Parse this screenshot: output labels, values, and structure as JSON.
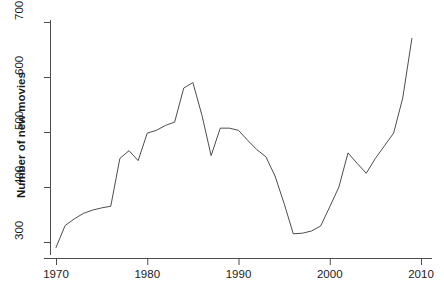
{
  "chart_data": {
    "type": "line",
    "title": "",
    "xlabel": "",
    "ylabel": "Number of new movies",
    "xlim": [
      1969,
      2010
    ],
    "ylim": [
      285,
      715
    ],
    "grid": false,
    "legend": null,
    "x_ticks": [
      "1970",
      "1980",
      "1990",
      "2000",
      "2010"
    ],
    "x_tick_values": [
      1970,
      1980,
      1990,
      2000,
      2010
    ],
    "y_ticks": [
      "300",
      "400",
      "500",
      "600",
      "700"
    ],
    "y_tick_values": [
      300,
      400,
      500,
      600,
      700
    ],
    "series": [
      {
        "name": "Number of new movies",
        "color": "#4d4d4d",
        "x": [
          1970,
          1971,
          1972,
          1973,
          1974,
          1975,
          1976,
          1977,
          1978,
          1979,
          1980,
          1981,
          1982,
          1983,
          1984,
          1985,
          1986,
          1987,
          1988,
          1989,
          1990,
          1991,
          1992,
          1993,
          1994,
          1995,
          1996,
          1997,
          1998,
          1999,
          2000,
          2001,
          2002,
          2003,
          2004,
          2005,
          2006,
          2007,
          2008,
          2009
        ],
        "values": [
          290,
          330,
          342,
          352,
          358,
          362,
          365,
          452,
          466,
          448,
          498,
          503,
          512,
          518,
          580,
          590,
          530,
          457,
          507,
          507,
          503,
          485,
          468,
          455,
          420,
          370,
          315,
          316,
          320,
          329,
          364,
          400,
          462,
          443,
          425,
          452,
          475,
          498,
          562,
          670
        ]
      }
    ]
  }
}
